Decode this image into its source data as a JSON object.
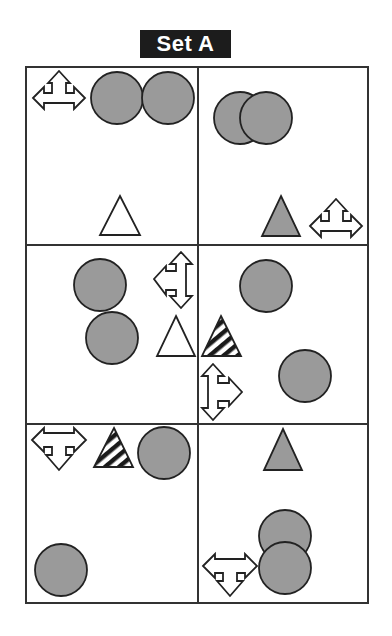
{
  "title": "Set A",
  "colors": {
    "grid_line": "#333333",
    "shape_fill_gray": "#9a9a9a",
    "shape_stroke": "#222222",
    "title_bg": "#1c1c1c",
    "title_text": "#ffffff"
  },
  "grid": {
    "rows": 3,
    "cols": 2
  },
  "cells": [
    {
      "row": 1,
      "col": 1,
      "shapes": [
        "arrow-left-up-right outline",
        "gray circle",
        "gray circle",
        "white triangle"
      ]
    },
    {
      "row": 1,
      "col": 2,
      "shapes": [
        "overlapping gray circles",
        "gray triangle",
        "arrow-left-up-right outline"
      ]
    },
    {
      "row": 2,
      "col": 1,
      "shapes": [
        "gray circle",
        "gray circle",
        "arrow-up-left-down outline",
        "white triangle"
      ]
    },
    {
      "row": 2,
      "col": 2,
      "shapes": [
        "gray circle",
        "striped triangle",
        "arrow-up-right-down outline",
        "gray circle"
      ]
    },
    {
      "row": 3,
      "col": 1,
      "shapes": [
        "arrow-left-down-right outline",
        "striped triangle",
        "gray circle",
        "gray circle"
      ]
    },
    {
      "row": 3,
      "col": 2,
      "shapes": [
        "gray triangle",
        "overlapping gray circles",
        "arrow-left-down-right outline"
      ]
    }
  ]
}
